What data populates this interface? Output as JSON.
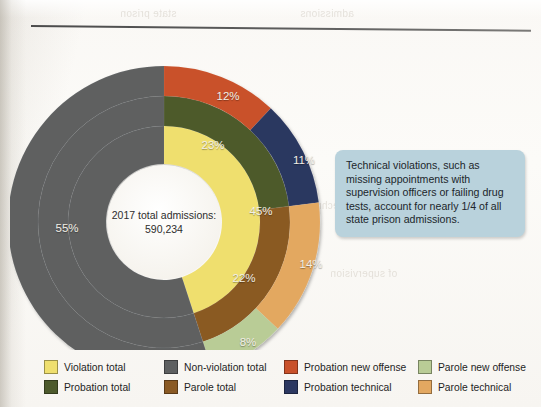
{
  "center": {
    "line1": "2017 total admissions:",
    "line2": "590,234"
  },
  "callout": {
    "text": "Technical violations, such as missing appointments with supervision officers or failing drug tests, account for nearly 1/4 of all state prison admissions.",
    "bg": "#b9d2dc"
  },
  "ghosts": [
    {
      "text": "state prison",
      "left": 120,
      "top": 8
    },
    {
      "text": "admissions",
      "left": 300,
      "top": 8
    },
    {
      "text": "technical violations",
      "left": 250,
      "top": 200
    },
    {
      "text": "of supervision",
      "left": 330,
      "top": 268
    },
    {
      "text": "people returned to",
      "left": 180,
      "top": 300
    },
    {
      "text": "prison for technical",
      "left": 150,
      "top": 330
    }
  ],
  "legend": {
    "items": [
      {
        "label": "Violation total",
        "color": "#efdf6e",
        "name": "violation-total"
      },
      {
        "label": "Non-violation total",
        "color": "#5e6061",
        "name": "non-violation-total"
      },
      {
        "label": "Probation new offense",
        "color": "#c9512a",
        "name": "probation-new-offense"
      },
      {
        "label": "Parole new offense",
        "color": "#b9cc96",
        "name": "parole-new-offense"
      },
      {
        "label": "Probation total",
        "color": "#4d5a2c",
        "name": "probation-total"
      },
      {
        "label": "Parole total",
        "color": "#8a5a24",
        "name": "parole-total"
      },
      {
        "label": "Probation technical",
        "color": "#2c3861",
        "name": "probation-technical"
      },
      {
        "label": "Parole technical",
        "color": "#e3a861",
        "name": "parole-technical"
      }
    ]
  },
  "chart_data": {
    "type": "pie",
    "title": "2017 total admissions: 590,234",
    "subtitle": "",
    "variant": "nested-donut-sunburst",
    "total_admissions": 590234,
    "units": "percent of total admissions",
    "start_angle_deg": 0,
    "direction": "clockwise",
    "legend_position": "bottom",
    "grid": false,
    "rings": [
      {
        "ring": 1,
        "name": "inner",
        "inner_radius_px": 58,
        "outer_radius_px": 96,
        "slices": [
          {
            "label": "Violation total",
            "value": 45,
            "display": "45%",
            "color": "#efdf6e"
          },
          {
            "label": "Non-violation total",
            "value": 55,
            "display": "55%",
            "color": "#5e6061"
          }
        ]
      },
      {
        "ring": 2,
        "name": "middle",
        "inner_radius_px": 96,
        "outer_radius_px": 126,
        "slices": [
          {
            "label": "Probation total",
            "value": 23,
            "display": "23%",
            "color": "#4d5a2c"
          },
          {
            "label": "Parole total",
            "value": 22,
            "display": "22%",
            "color": "#8a5a24"
          },
          {
            "label": "Non-violation total",
            "value": 55,
            "display": "",
            "color": "#5e6061"
          }
        ]
      },
      {
        "ring": 3,
        "name": "outer",
        "inner_radius_px": 126,
        "outer_radius_px": 156,
        "slices": [
          {
            "label": "Probation new offense",
            "value": 12,
            "display": "12%",
            "color": "#c9512a"
          },
          {
            "label": "Probation technical",
            "value": 11,
            "display": "11%",
            "color": "#2c3861"
          },
          {
            "label": "Parole technical",
            "value": 14,
            "display": "14%",
            "color": "#e3a861"
          },
          {
            "label": "Parole new offense",
            "value": 8,
            "display": "8%",
            "color": "#b9cc96"
          },
          {
            "label": "Non-violation total",
            "value": 55,
            "display": "",
            "color": "#5e6061"
          }
        ]
      }
    ],
    "labels": [
      {
        "text": "12%",
        "x": 218,
        "y": 66,
        "ring": 3
      },
      {
        "text": "11%",
        "x": 294,
        "y": 130,
        "ring": 3
      },
      {
        "text": "14%",
        "x": 301,
        "y": 234,
        "ring": 3
      },
      {
        "text": "8%",
        "x": 238,
        "y": 312,
        "ring": 3
      },
      {
        "text": "23%",
        "x": 203,
        "y": 115,
        "ring": 2
      },
      {
        "text": "22%",
        "x": 234,
        "y": 248,
        "ring": 2
      },
      {
        "text": "45%",
        "x": 251,
        "y": 181,
        "ring": 1
      },
      {
        "text": "55%",
        "x": 57,
        "y": 198,
        "ring": 1
      }
    ]
  }
}
